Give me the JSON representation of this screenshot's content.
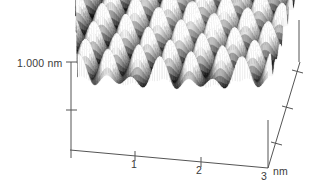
{
  "figure": {
    "kind": "stm-afm-3d-topography",
    "background_color": "#ffffff",
    "axis_color": "#555555",
    "text_color": "#3a3a3a"
  },
  "axes": {
    "z": {
      "label": "1.000 nm",
      "ticks": [
        "",
        ""
      ],
      "range_nm": [
        0,
        1.0
      ],
      "top_px": 62,
      "bottom_px": 158
    },
    "x": {
      "unit": "nm",
      "tick_labels": [
        "1",
        "2",
        "3"
      ],
      "tick_values": [
        1,
        2,
        3
      ],
      "range_nm": [
        0,
        3
      ]
    },
    "y": {
      "unit": "nm",
      "tick_labels": [
        "",
        "",
        ""
      ],
      "tick_count": 3,
      "range_nm": [
        0,
        3
      ]
    }
  },
  "chart_data": {
    "type": "heatmap",
    "title": "",
    "subtitle": "",
    "xlabel": "nm",
    "ylabel": "nm",
    "zlabel": "1.000 nm",
    "xlim": [
      0,
      3
    ],
    "ylim": [
      0,
      3
    ],
    "zlim": [
      0,
      1.0
    ],
    "grid": false,
    "legend": "none",
    "colormap": "grayscale",
    "surface": {
      "lattice": "honeycomb",
      "lattice_constant_nm": 0.42,
      "corrugation_nm": 0.35,
      "pit_depth_relative": 1.0,
      "description": "periodic hexagonal array of dark depressions separated by bright ridges"
    },
    "projection": {
      "corner_back_left": [
        75,
        22
      ],
      "corner_back_right": [
        299,
        20
      ],
      "corner_front_right": [
        268,
        120
      ],
      "corner_front_left": [
        78,
        118
      ],
      "z_scale_px": 96
    }
  }
}
